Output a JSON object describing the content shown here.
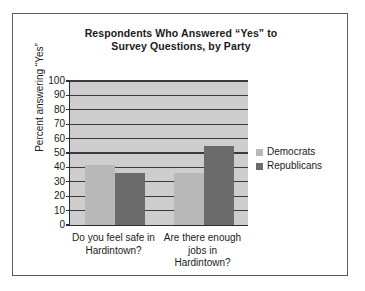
{
  "chart_data": {
    "type": "bar",
    "title": "Respondents Who Answered “Yes” to Survey Questions, by Party",
    "title_lines": [
      "Respondents Who Answered “Yes” to",
      "Survey Questions, by Party"
    ],
    "xlabel": "",
    "ylabel": "Percent answering “Yes”",
    "ylim": [
      0,
      100
    ],
    "ytick_step": 10,
    "yticks": [
      100,
      90,
      80,
      70,
      60,
      50,
      40,
      30,
      20,
      10,
      0
    ],
    "grid": true,
    "legend_position": "right",
    "categories": [
      "Do you feel safe in Hardintown?",
      "Are there enough jobs in Hardintown?"
    ],
    "category_label_lines": [
      [
        "Do you feel safe in",
        "Hardintown?"
      ],
      [
        "Are there enough",
        "jobs in",
        "Hardintown?"
      ]
    ],
    "series": [
      {
        "name": "Democrats",
        "color": "#b8b8b8",
        "values": [
          42,
          36
        ]
      },
      {
        "name": "Republicans",
        "color": "#6b6b6b",
        "values": [
          36,
          55
        ]
      }
    ]
  },
  "colors": {
    "democrats": "#b8b8b8",
    "republicans": "#6b6b6b",
    "plot_background": "#cdcdcd",
    "gridline": "#3a3a3a",
    "axis": "#2c2c2c",
    "frame": "#5a5a5a",
    "page_background": "#ffffff"
  }
}
